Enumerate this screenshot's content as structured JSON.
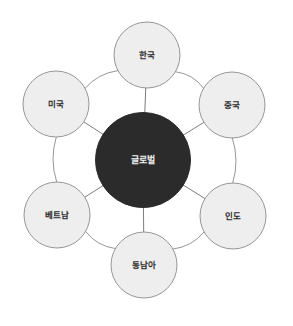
{
  "diagram": {
    "type": "hub-and-spoke",
    "background_color": "#ffffff",
    "hub": {
      "label": "글로벌",
      "cx": 143,
      "cy": 160,
      "r": 47.5,
      "fill": "#2b2b2b",
      "text_color": "#f2f2f2"
    },
    "satellite_style": {
      "r": 33,
      "fill": "#eeeeee",
      "stroke": "#8a8a8a",
      "stroke_width": 0.9,
      "text_color": "#2b2b2b"
    },
    "connector_style": {
      "stroke": "#8a8a8a",
      "stroke_width": 0.9,
      "spoke_stroke": "#6e6e6e"
    },
    "satellites": [
      {
        "id": "korea",
        "label": "한국",
        "cx": 147,
        "cy": 55,
        "angle": -90
      },
      {
        "id": "china",
        "label": "중국",
        "cx": 232,
        "cy": 105,
        "angle": -30
      },
      {
        "id": "india",
        "label": "인도",
        "cx": 233,
        "cy": 216,
        "angle": 30
      },
      {
        "id": "southeast-asia",
        "label": "동남아",
        "cx": 144,
        "cy": 265,
        "angle": 90
      },
      {
        "id": "vietnam",
        "label": "베트남",
        "cx": 57,
        "cy": 215,
        "angle": 150
      },
      {
        "id": "usa",
        "label": "미국",
        "cx": 56,
        "cy": 104,
        "angle": -150
      }
    ],
    "ring_connections": [
      {
        "from": "usa",
        "to": "korea"
      },
      {
        "from": "korea",
        "to": "china"
      },
      {
        "from": "china",
        "to": "india"
      },
      {
        "from": "india",
        "to": "southeast-asia"
      },
      {
        "from": "southeast-asia",
        "to": "vietnam"
      },
      {
        "from": "vietnam",
        "to": "usa"
      }
    ],
    "spoke_connections": [
      {
        "from": "hub",
        "to": "korea"
      },
      {
        "from": "hub",
        "to": "china"
      },
      {
        "from": "hub",
        "to": "india"
      },
      {
        "from": "hub",
        "to": "southeast-asia"
      },
      {
        "from": "hub",
        "to": "vietnam"
      },
      {
        "from": "hub",
        "to": "usa"
      }
    ]
  }
}
